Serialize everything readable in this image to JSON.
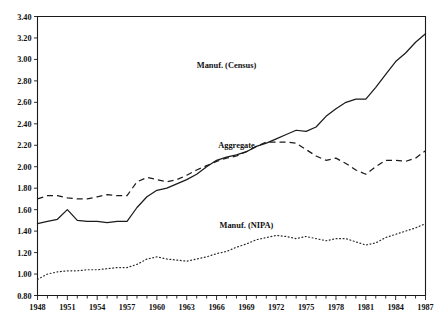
{
  "chart_data": {
    "type": "line",
    "title": "",
    "subtitle": "",
    "xlabel": "",
    "ylabel": "",
    "xlim": [
      1948,
      1987
    ],
    "ylim": [
      0.8,
      3.4
    ],
    "grid": false,
    "legend_position": "inline-annotations",
    "y_ticks": [
      "0.80",
      "1.00",
      "1.20",
      "1.40",
      "1.60",
      "1.80",
      "2.00",
      "2.20",
      "2.40",
      "2.60",
      "2.80",
      "3.00",
      "3.20",
      "3.40"
    ],
    "y_tick_values": [
      0.8,
      1.0,
      1.2,
      1.4,
      1.6,
      1.8,
      2.0,
      2.2,
      2.4,
      2.6,
      2.8,
      3.0,
      3.2,
      3.4
    ],
    "x_ticks": [
      "1948",
      "1951",
      "1954",
      "1957",
      "1960",
      "1963",
      "1966",
      "1969",
      "1972",
      "1975",
      "1978",
      "1981",
      "1984",
      "1987"
    ],
    "x_tick_values": [
      1948,
      1951,
      1954,
      1957,
      1960,
      1963,
      1966,
      1969,
      1972,
      1975,
      1978,
      1981,
      1984,
      1987
    ],
    "x_minor_step": 1,
    "x": [
      1948,
      1949,
      1950,
      1951,
      1952,
      1953,
      1954,
      1955,
      1956,
      1957,
      1958,
      1959,
      1960,
      1961,
      1962,
      1963,
      1964,
      1965,
      1966,
      1967,
      1968,
      1969,
      1970,
      1971,
      1972,
      1973,
      1974,
      1975,
      1976,
      1977,
      1978,
      1979,
      1980,
      1981,
      1982,
      1983,
      1984,
      1985,
      1986,
      1987
    ],
    "series": [
      {
        "name": "Manuf. (Census)",
        "style": "solid",
        "label_x": 1967,
        "label_y": 2.92,
        "values": [
          1.47,
          1.49,
          1.51,
          1.6,
          1.5,
          1.49,
          1.49,
          1.48,
          1.49,
          1.49,
          1.62,
          1.72,
          1.78,
          1.8,
          1.84,
          1.88,
          1.93,
          2.0,
          2.06,
          2.09,
          2.11,
          2.14,
          2.19,
          2.22,
          2.26,
          2.3,
          2.34,
          2.33,
          2.37,
          2.47,
          2.54,
          2.6,
          2.63,
          2.63,
          2.74,
          2.86,
          2.98,
          3.06,
          3.16,
          3.24
        ]
      },
      {
        "name": "Aggregate",
        "style": "dashed",
        "label_x": 1968,
        "label_y": 2.17,
        "values": [
          1.7,
          1.73,
          1.73,
          1.71,
          1.7,
          1.7,
          1.72,
          1.74,
          1.73,
          1.73,
          1.86,
          1.9,
          1.88,
          1.86,
          1.88,
          1.92,
          1.97,
          2.01,
          2.05,
          2.08,
          2.1,
          2.14,
          2.19,
          2.23,
          2.23,
          2.23,
          2.22,
          2.16,
          2.1,
          2.06,
          2.08,
          2.03,
          1.97,
          1.93,
          2.0,
          2.06,
          2.06,
          2.05,
          2.08,
          2.15
        ]
      },
      {
        "name": "Manuf. (NIPA)",
        "style": "dotted",
        "label_x": 1969,
        "label_y": 1.43,
        "values": [
          0.95,
          1.0,
          1.02,
          1.03,
          1.03,
          1.04,
          1.04,
          1.05,
          1.06,
          1.06,
          1.09,
          1.14,
          1.16,
          1.14,
          1.13,
          1.12,
          1.14,
          1.16,
          1.19,
          1.21,
          1.25,
          1.28,
          1.32,
          1.34,
          1.36,
          1.35,
          1.33,
          1.35,
          1.33,
          1.31,
          1.33,
          1.33,
          1.3,
          1.27,
          1.29,
          1.34,
          1.37,
          1.4,
          1.43,
          1.47
        ]
      }
    ]
  },
  "labels": {
    "census": "Manuf. (Census)",
    "aggregate": "Aggregate",
    "nipa": "Manuf. (NIPA)"
  },
  "colors": {
    "axis": "#1a1a1a",
    "series": "#1b1b1b",
    "background": "#ffffff"
  }
}
